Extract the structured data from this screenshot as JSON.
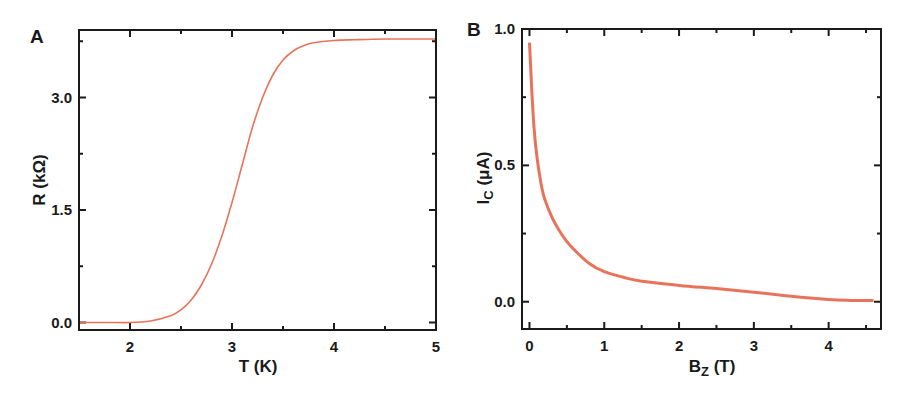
{
  "figure": {
    "panels": [
      "A",
      "B"
    ],
    "curve_color": "#e8735a",
    "frame_color": "#1a1a1a"
  },
  "chart_data": [
    {
      "panel": "A",
      "type": "line",
      "title": "",
      "xlabel": "T (K)",
      "ylabel": "R (kΩ)",
      "xlim": [
        1.5,
        5.0
      ],
      "ylim": [
        -0.1,
        3.9
      ],
      "xticks": [
        2,
        3,
        4,
        5
      ],
      "xtick_labels": [
        "2",
        "3",
        "4",
        "5"
      ],
      "yticks": [
        0.0,
        1.5,
        3.0
      ],
      "ytick_labels": [
        "0.0",
        "1.5",
        "3.0"
      ],
      "grid": false,
      "legend": null,
      "series": [
        {
          "name": "R(T)",
          "color": "#e8735a",
          "x": [
            1.5,
            1.8,
            2.0,
            2.2,
            2.4,
            2.5,
            2.6,
            2.7,
            2.8,
            2.9,
            3.0,
            3.1,
            3.2,
            3.3,
            3.4,
            3.5,
            3.6,
            3.7,
            3.8,
            4.0,
            4.2,
            4.5,
            5.0
          ],
          "y": [
            0.0,
            0.0,
            0.0,
            0.02,
            0.09,
            0.17,
            0.3,
            0.5,
            0.78,
            1.15,
            1.6,
            2.1,
            2.6,
            3.0,
            3.3,
            3.5,
            3.62,
            3.69,
            3.73,
            3.76,
            3.77,
            3.78,
            3.78
          ]
        }
      ]
    },
    {
      "panel": "B",
      "type": "line",
      "title": "",
      "xlabel": "B_z (T)",
      "ylabel": "I_c (μA)",
      "xlim": [
        -0.1,
        4.7
      ],
      "ylim": [
        -0.1,
        1.0
      ],
      "xticks": [
        0,
        1,
        2,
        3,
        4
      ],
      "xtick_labels": [
        "0",
        "1",
        "2",
        "3",
        "4"
      ],
      "yticks": [
        0.0,
        0.5,
        1.0
      ],
      "ytick_labels": [
        "0.0",
        "0.5",
        "1.0"
      ],
      "grid": false,
      "legend": null,
      "series": [
        {
          "name": "Ic(Bz)",
          "color": "#e8735a",
          "x": [
            0.0,
            0.03,
            0.06,
            0.1,
            0.15,
            0.2,
            0.3,
            0.4,
            0.5,
            0.6,
            0.8,
            1.0,
            1.25,
            1.5,
            2.0,
            2.5,
            3.0,
            3.5,
            4.0,
            4.3,
            4.6
          ],
          "y": [
            0.95,
            0.78,
            0.64,
            0.53,
            0.44,
            0.38,
            0.31,
            0.26,
            0.22,
            0.19,
            0.14,
            0.11,
            0.09,
            0.075,
            0.06,
            0.048,
            0.035,
            0.02,
            0.008,
            0.005,
            0.005
          ]
        }
      ]
    }
  ]
}
